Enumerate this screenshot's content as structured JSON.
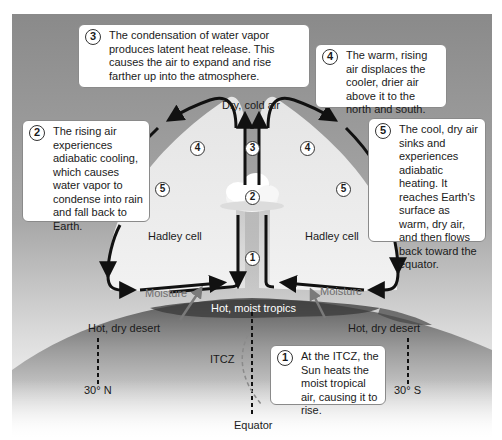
{
  "diagram": {
    "colors": {
      "sky": "#8c8c8c",
      "cell_fill": "#e8e8e8",
      "arrow": "#111111",
      "moisture_arrow": "#7a7a7a",
      "earth_dark": "#3f3f3f",
      "earth_light": "#bdbdbd"
    },
    "callouts": [
      {
        "num": "1",
        "text": "At the ITCZ, the Sun heats the moist tropical air, causing it to rise."
      },
      {
        "num": "2",
        "text": "The rising air experiences adiabatic cooling, which causes water vapor to condense into rain and fall back to Earth."
      },
      {
        "num": "3",
        "text": "The condensation of water vapor produces latent heat release. This causes the air to expand and rise farther up into the atmosphere."
      },
      {
        "num": "4",
        "text": "The warm, rising air displaces the cooler, drier air above it to the north and south."
      },
      {
        "num": "5",
        "text": "The cool, dry air sinks and experiences adiabatic heating. It reaches Earth's surface as warm, dry air, and then flows back toward the equator."
      }
    ],
    "labels": {
      "dry_cold_air": "Dry, cold air",
      "hadley_left": "Hadley cell",
      "hadley_right": "Hadley cell",
      "moisture_left": "Moisture",
      "moisture_right": "Moisture",
      "hot_moist_tropics": "Hot, moist tropics",
      "hot_dry_desert_left": "Hot, dry desert",
      "hot_dry_desert_right": "Hot, dry desert",
      "itcz": "ITCZ",
      "lat_north": "30° N",
      "lat_south": "30° S",
      "equator": "Equator"
    },
    "markers": {
      "m1": "1",
      "m2": "2",
      "m3": "3",
      "m4_left": "4",
      "m4_right": "4",
      "m5_left": "5",
      "m5_right": "5"
    }
  }
}
